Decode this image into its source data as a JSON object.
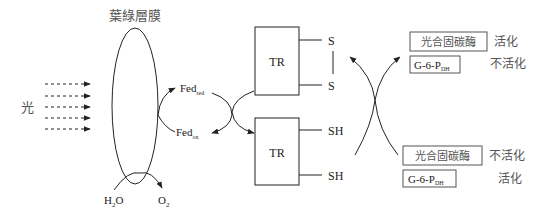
{
  "diagram": {
    "membrane_label": "葉綠層膜",
    "light_label": "光",
    "water_label": "H",
    "water_sub": "2",
    "water_tail": "O",
    "oxygen_label": "O",
    "oxygen_sub": "2",
    "fed_red": {
      "base": "Fed",
      "sub": "red"
    },
    "fed_ox": {
      "base": "Fed",
      "sub": "ox"
    },
    "tr_oxidized": {
      "label": "TR",
      "groups": [
        "S",
        "S"
      ]
    },
    "tr_reduced": {
      "label": "TR",
      "groups": [
        "SH",
        "SH"
      ]
    },
    "top_enzymes": [
      {
        "name": "光合固碳酶",
        "state": "活化"
      },
      {
        "name_base": "G-6-P",
        "name_sub": "DH",
        "state": "不活化"
      }
    ],
    "bottom_enzymes": [
      {
        "name": "光合固碳酶",
        "state": "不活化"
      },
      {
        "name_base": "G-6-P",
        "name_sub": "DH",
        "state": "活化"
      }
    ],
    "colors": {
      "line": "#222222",
      "cjk_text": "#555555"
    }
  }
}
